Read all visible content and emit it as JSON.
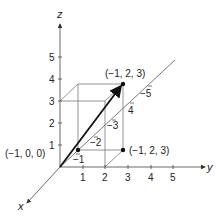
{
  "diagram": {
    "type": "3d-coordinate-vector",
    "axes": {
      "x": {
        "label": "x"
      },
      "y": {
        "label": "y",
        "ticks": [
          "1",
          "2",
          "3",
          "4",
          "5"
        ]
      },
      "z": {
        "label": "z",
        "ticks": [
          "1",
          "2",
          "3",
          "4",
          "5"
        ]
      },
      "negative_x": {
        "ticks": [
          "−1",
          "−2",
          "−3",
          "4",
          "−5"
        ]
      }
    },
    "points": [
      {
        "label": "(−1, 0, 0)"
      },
      {
        "label": "(−1, 2, 3)"
      },
      {
        "label": "(−1, 2, 3)"
      }
    ],
    "vector": {
      "from": "origin",
      "to": "(-1, 2, 3)"
    },
    "colors": {
      "line": "#333333",
      "axis": "#444444",
      "text": "#222222"
    }
  }
}
